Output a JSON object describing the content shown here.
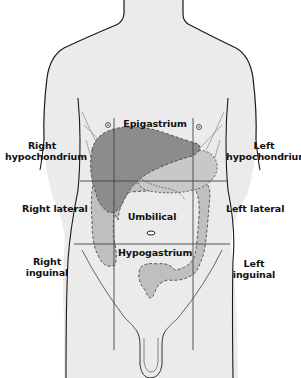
{
  "diagram": {
    "colors": {
      "background": "#ffffff",
      "body_fill": "#ebebeb",
      "outline": "#1a1a1a",
      "liver": "#8c8c8c",
      "organs": "#bfbfbf",
      "grid_lines": "#444444"
    },
    "regions": {
      "right_hypochondrium": [
        "Right",
        "hypochondrium"
      ],
      "epigastrium": "Epigastrium",
      "left_hypochondrium": [
        "Left",
        "hypochondrium"
      ],
      "right_lateral": "Right lateral",
      "umbilical": "Umbilical",
      "left_lateral": "Left lateral",
      "right_inguinal": [
        "Right",
        "inguinal"
      ],
      "hypogastrium": "Hypogastrium",
      "left_inguinal": [
        "Left",
        "inguinal"
      ]
    },
    "grid": {
      "vertical_x": [
        114,
        193
      ],
      "horizontal_y": [
        181,
        244
      ]
    }
  }
}
